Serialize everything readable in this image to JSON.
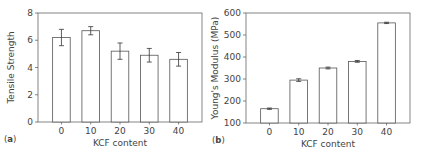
{
  "chart_data": [
    {
      "panel": "(a)",
      "panel_letter": "a",
      "type": "bar",
      "categories": [
        "0",
        "10",
        "20",
        "30",
        "40"
      ],
      "values": [
        6.2,
        6.7,
        5.2,
        4.9,
        4.6
      ],
      "errors": [
        0.6,
        0.3,
        0.6,
        0.5,
        0.5
      ],
      "title": "",
      "xlabel": "KCF content",
      "ylabel": "Tensile Strength",
      "ylim": [
        0,
        8
      ],
      "yticks": [
        "0",
        "2",
        "4",
        "6",
        "8"
      ],
      "grid": false,
      "bar_fill": "#ffffff",
      "bar_stroke": "#555555"
    },
    {
      "panel": "(b)",
      "panel_letter": "b",
      "type": "bar",
      "categories": [
        "0",
        "10",
        "20",
        "30",
        "40"
      ],
      "values": [
        165,
        295,
        350,
        380,
        555
      ],
      "errors": [
        3,
        6,
        4,
        4,
        3
      ],
      "title": "",
      "xlabel": "KCF content",
      "ylabel": "Young's Modulus (MPa)",
      "ylim": [
        100,
        600
      ],
      "yticks": [
        "100",
        "200",
        "300",
        "400",
        "500",
        "600"
      ],
      "grid": false,
      "bar_fill": "#ffffff",
      "bar_stroke": "#555555"
    }
  ]
}
